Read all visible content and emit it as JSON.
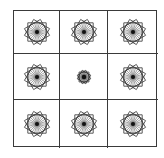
{
  "puzzle": {
    "rows": 3,
    "cols": 3,
    "line_color": "#3a3a3a",
    "figure_color": "#333333",
    "cells": [
      {
        "row": 1,
        "col": 1,
        "shape": "rosette-icon",
        "size": "large"
      },
      {
        "row": 1,
        "col": 2,
        "shape": "rosette-icon",
        "size": "large"
      },
      {
        "row": 1,
        "col": 3,
        "shape": "rosette-icon",
        "size": "large"
      },
      {
        "row": 2,
        "col": 1,
        "shape": "rosette-icon",
        "size": "large"
      },
      {
        "row": 2,
        "col": 2,
        "shape": "rosette-icon",
        "size": "small"
      },
      {
        "row": 2,
        "col": 3,
        "shape": "rosette-icon",
        "size": "large"
      },
      {
        "row": 3,
        "col": 1,
        "shape": "rosette-icon",
        "size": "large"
      },
      {
        "row": 3,
        "col": 2,
        "shape": "rosette-icon",
        "size": "large"
      },
      {
        "row": 3,
        "col": 3,
        "shape": "rosette-icon",
        "size": "large"
      }
    ]
  }
}
